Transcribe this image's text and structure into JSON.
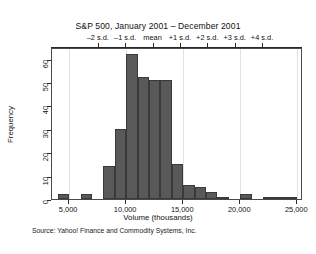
{
  "chart_data": {
    "type": "bar",
    "title": "S&P 500, January 2001 – December 2001",
    "xlabel": "Volume (thousands)",
    "ylabel": "Frequency",
    "source": "Source:  Yahoo! Finance and Commodity Systems, Inc.",
    "grid": "vertical",
    "legend": "none",
    "xlim": [
      3500,
      25500
    ],
    "ylim": [
      0,
      65
    ],
    "bin_width": 1000,
    "x_ticks": [
      5000,
      10000,
      15000,
      20000,
      25000
    ],
    "x_tick_labels": [
      "5,000",
      "10,000",
      "15,000",
      "20,000",
      "25,000"
    ],
    "y_ticks": [
      0,
      10,
      20,
      30,
      40,
      50,
      60
    ],
    "y_tick_labels": [
      "0",
      "10",
      "20",
      "30",
      "40",
      "50",
      "60"
    ],
    "categories": [
      "4,000–5,000",
      "5,000–6,000",
      "6,000–7,000",
      "7,000–8,000",
      "8,000–9,000",
      "9,000–10,000",
      "10,000–11,000",
      "11,000–12,000",
      "12,000–13,000",
      "13,000–14,000",
      "14,000–15,000",
      "15,000–16,000",
      "16,000–17,000",
      "17,000–18,000",
      "18,000–19,000",
      "19,000–20,000",
      "20,000–21,000",
      "21,000–22,000",
      "22,000–23,000",
      "23,000–24,000",
      "24,000–25,000"
    ],
    "bin_starts": [
      4000,
      5000,
      6000,
      7000,
      8000,
      9000,
      10000,
      11000,
      12000,
      13000,
      14000,
      15000,
      16000,
      17000,
      18000,
      19000,
      20000,
      21000,
      22000,
      23000,
      24000
    ],
    "values": [
      2,
      0,
      2,
      0,
      14,
      30,
      62,
      52,
      51,
      51,
      15,
      6,
      5,
      3,
      1,
      0,
      2,
      0,
      1,
      1,
      1
    ],
    "secondary_axis": {
      "label_suffix": "s.d.",
      "ticks": [
        {
          "label": "–2 s.d.",
          "volume": 7600
        },
        {
          "label": "–1 s.d.",
          "volume": 10000
        },
        {
          "label": "mean",
          "volume": 12400
        },
        {
          "label": "+1 s.d.",
          "volume": 14800
        },
        {
          "label": "+2 s.d.",
          "volume": 17200
        },
        {
          "label": "+3 s.d.",
          "volume": 19600
        },
        {
          "label": "+4 s.d.",
          "volume": 22000
        }
      ]
    },
    "colors": {
      "bar_fill": "#595959",
      "bar_stroke": "#3a3a3a",
      "grid": "#e2e2e2",
      "axis": "#2b2b2b",
      "text": "#111111",
      "background": "#ffffff"
    }
  }
}
